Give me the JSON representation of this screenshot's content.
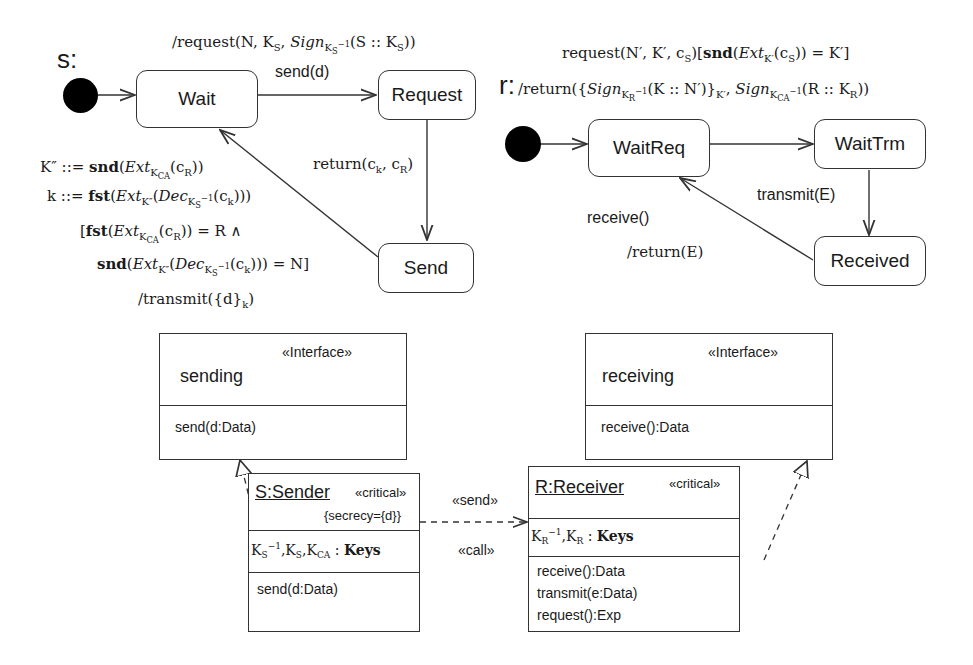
{
  "sender_statechart": {
    "name": "s:",
    "states": [
      "Wait",
      "Request",
      "Send"
    ],
    "transitions": {
      "wait_to_request_trigger": "send(d)",
      "wait_to_request_action": "/request(N, Kₛ, Sign",
      "request_to_send": "return(cₖ, cᵣ)",
      "send_to_wait_lines": [
        "K″ ::= snd(Ext_KCA(c_R))",
        "k ::= fst(Ext_K″(Dec_KS⁻¹(c_k)))",
        "[fst(Ext_KCA(c_R)) = R ∧",
        "snd(Ext_K″(Dec_KS⁻¹(c_k))) = N]",
        "/transmit({d}_k)"
      ]
    }
  },
  "receiver_statechart": {
    "name": "r:",
    "states": [
      "WaitReq",
      "WaitTrm",
      "Received"
    ],
    "transitions": {
      "waitreq_to_waittrm_trigger": "request(N′, K′, c_S)[snd(Ext_K′(c_S)) = K′]",
      "waitreq_to_waittrm_action": "/return({Sign_KR⁻¹(K :: N′)}_K′, Sign_KCA⁻¹(R :: K_R))",
      "waittrm_to_received": "transmit(E)",
      "received_to_waitreq_trigger": "receive()",
      "received_to_waitreq_action": "/return(E)"
    }
  },
  "interfaces": [
    {
      "stereotype": "«Interface»",
      "name": "sending",
      "operation": "send(d:Data)"
    },
    {
      "stereotype": "«Interface»",
      "name": "receiving",
      "operation": "receive():Data"
    }
  ],
  "components": [
    {
      "name": "S:Sender",
      "stereotype": "«critical»",
      "tag": "{secrecy={d}}",
      "attributes": "K_S⁻¹, K_S, K_CA : Keys",
      "operations": [
        "send(d:Data)"
      ]
    },
    {
      "name": "R:Receiver",
      "stereotype": "«critical»",
      "attributes": "K_R⁻¹, K_R : Keys",
      "operations": [
        "receive():Data",
        "transmit(e:Data)",
        "request():Exp"
      ]
    }
  ],
  "dependency": {
    "stereotypes": [
      "«send»",
      "«call»"
    ]
  }
}
